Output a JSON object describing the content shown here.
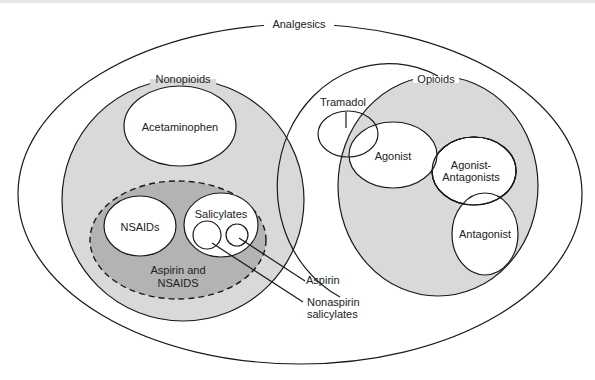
{
  "diagram": {
    "title": "Analgesics",
    "groups": {
      "nonopioids": {
        "label": "Nonopioids",
        "members": {
          "acetaminophen": "Acetaminophen",
          "aspirin_nsaids_label_1": "Aspirin and",
          "aspirin_nsaids_label_2": "NSAIDS",
          "nsaids": "NSAIDs",
          "salicylates": "Salicylates"
        }
      },
      "opioids": {
        "label": "Opioids",
        "members": {
          "agonist": "Agonist",
          "agonist_antagonists_1": "Agonist-",
          "agonist_antagonists_2": "Antagonists",
          "antagonist": "Antagonist"
        }
      },
      "tramadol": "Tramadol"
    },
    "callouts": {
      "aspirin": "Aspirin",
      "nonaspirin_1": "Nonaspirin",
      "nonaspirin_2": "salicylates"
    },
    "colors": {
      "light_fill": "#d9d9d9",
      "dark_fill": "#b3b3b3",
      "stroke": "#1a1a1a",
      "background": "#ffffff"
    }
  }
}
